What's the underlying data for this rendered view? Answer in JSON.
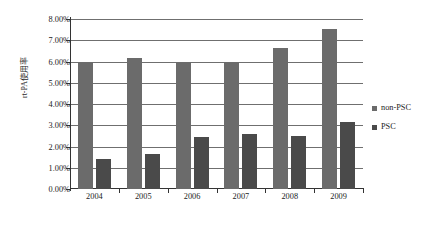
{
  "chart_data": {
    "type": "bar",
    "title": "",
    "subtitle": "",
    "xlabel": "",
    "ylabel": "rt-PA使用率",
    "categories": [
      "2004",
      "2005",
      "2006",
      "2007",
      "2008",
      "2009"
    ],
    "series": [
      {
        "name": "non-PSC",
        "color": "#6b6b6b",
        "values": [
          6.0,
          6.15,
          6.0,
          6.0,
          6.65,
          7.55
        ]
      },
      {
        "name": "PSC",
        "color": "#4a4a4a",
        "values": [
          1.4,
          1.65,
          2.45,
          2.6,
          2.5,
          3.15
        ]
      }
    ],
    "ylim": [
      0,
      8
    ],
    "ytick_values": [
      0,
      1,
      2,
      3,
      4,
      5,
      6,
      7,
      8
    ],
    "ytick_labels": [
      "0.00%",
      "1.00%",
      "2.00%",
      "3.00%",
      "4.00%",
      "5.00%",
      "6.00%",
      "7.00%",
      "8.00%"
    ],
    "unit": "%",
    "grid": true,
    "grid_axis": "y",
    "legend_position": "right",
    "legend": [
      "non-PSC",
      "PSC"
    ]
  }
}
